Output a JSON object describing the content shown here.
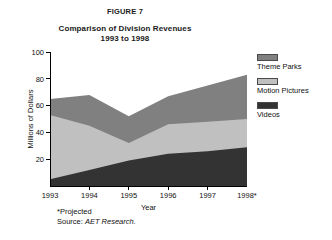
{
  "figure": {
    "number_label": "FIGURE 7",
    "title_line1": "Comparison of Division Revenues",
    "title_line2": "1993 to 1998"
  },
  "legend": {
    "position": "right",
    "entries": [
      {
        "label": "Theme Parks",
        "color": "#808080",
        "swatch_name": "legend-swatch-theme-parks"
      },
      {
        "label": "Motion Pictures",
        "color": "#c0c0c0",
        "swatch_name": "legend-swatch-motion-pictures"
      },
      {
        "label": "Videos",
        "color": "#333333",
        "swatch_name": "legend-swatch-videos"
      }
    ]
  },
  "footnotes": {
    "projected_note": "*Projected",
    "source_prefix": "Source: ",
    "source_name": "AET Research."
  },
  "chart_data": {
    "type": "area",
    "stacked": true,
    "title": "Comparison of Division Revenues 1993 to 1998",
    "xlabel": "Year",
    "ylabel": "Millions of Dollars",
    "categories": [
      "1993",
      "1994",
      "1995",
      "1996",
      "1997",
      "1998*"
    ],
    "x_tick_labels": [
      "1993",
      "1994",
      "1995",
      "1996",
      "1997",
      "1998*"
    ],
    "y_tick_labels": [
      "20",
      "40",
      "60",
      "80",
      "100"
    ],
    "y_ticks": [
      20,
      40,
      60,
      80,
      100
    ],
    "ylim": [
      0,
      100
    ],
    "grid": false,
    "series": [
      {
        "name": "Videos",
        "color": "#333333",
        "values": [
          5,
          12,
          19,
          24,
          26,
          29
        ]
      },
      {
        "name": "Motion Pictures",
        "color": "#c0c0c0",
        "values": [
          48,
          33,
          13,
          22,
          22,
          21
        ]
      },
      {
        "name": "Theme Parks",
        "color": "#808080",
        "values": [
          12,
          23,
          20,
          21,
          27,
          33
        ]
      }
    ],
    "cumulative_totals": [
      65,
      68,
      52,
      67,
      75,
      83
    ]
  }
}
